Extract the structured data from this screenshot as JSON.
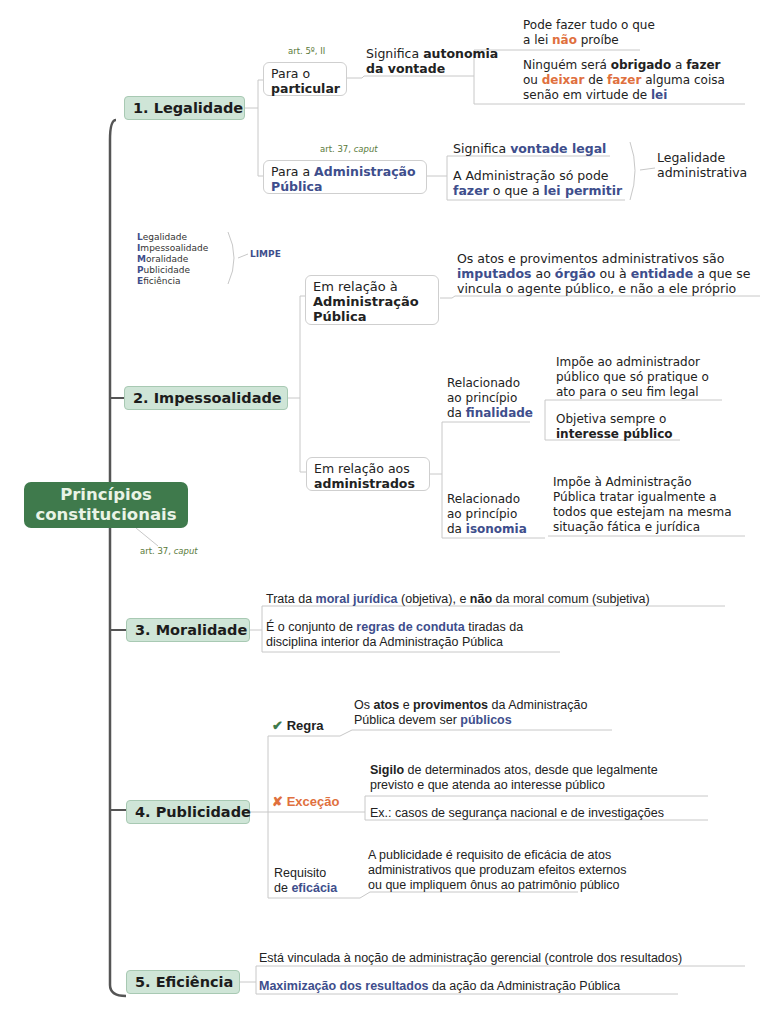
{
  "central": {
    "line1": "Princípios",
    "line2": "constitucionais",
    "note_prefix": "art. 37, ",
    "note_italic": "caput"
  },
  "colors": {
    "central_bg": "#3f7a4c",
    "main_bg": "#cfe5d7",
    "blue": "#3e4e8c",
    "orange": "#e0703e",
    "note": "#5a7a3a"
  },
  "legalidade": {
    "title": "1. Legalidade",
    "particular": {
      "note": "art. 5º, II",
      "line1": "Para o",
      "line2": "particular",
      "meaning_a": "Significa ",
      "meaning_b": "autonomia",
      "meaning_c": "da vontade",
      "leaf1_a": "Pode fazer tudo o que",
      "leaf1_b": "a lei ",
      "leaf1_c": "não",
      "leaf1_d": " proíbe",
      "leaf2_a": "Ninguém será ",
      "leaf2_b": "obrigado",
      "leaf2_c": " a ",
      "leaf2_d": "fazer",
      "leaf2_e": "ou ",
      "leaf2_f": "deixar",
      "leaf2_g": " de ",
      "leaf2_h": "fazer",
      "leaf2_i": " alguma coisa",
      "leaf2_j": "senão em virtude de ",
      "leaf2_k": "lei"
    },
    "adm": {
      "note_prefix": "art. 37, ",
      "note_italic": "caput",
      "line1a": "Para a ",
      "line1b": "Administração",
      "line2": "Pública",
      "leaf1_a": "Significa ",
      "leaf1_b": "vontade legal",
      "leaf2_a": "A Administração só pode",
      "leaf2_b": "fazer",
      "leaf2_c": " o que a ",
      "leaf2_d": "lei permitir",
      "summary1": "Legalidade",
      "summary2": "administrativa"
    }
  },
  "limpe": {
    "items": [
      {
        "first": "L",
        "rest": "egalidade"
      },
      {
        "first": "I",
        "rest": "mpessoalidade"
      },
      {
        "first": "M",
        "rest": "oralidade"
      },
      {
        "first": "P",
        "rest": "ublicidade"
      },
      {
        "first": "E",
        "rest": "ficiência"
      }
    ],
    "label": "LIMPE"
  },
  "impessoalidade": {
    "title": "2. Impessoalidade",
    "adm": {
      "line1": "Em relação à",
      "line2": "Administração",
      "line3": "Pública",
      "leaf_a": "Os atos e provimentos administrativos são",
      "leaf_b": "imputados",
      "leaf_c": " ao ",
      "leaf_d": "órgão",
      "leaf_e": " ou à ",
      "leaf_f": "entidade",
      "leaf_g": " a que se",
      "leaf_h": "vincula o agente público, e não a ele próprio"
    },
    "administrados": {
      "line1": "Em relação aos",
      "line2": "administrados",
      "finalidade": {
        "l1": "Relacionado",
        "l2": "ao princípio",
        "l3a": "da ",
        "l3b": "finalidade",
        "leaf1_a": "Impõe ao administrador",
        "leaf1_b": "público que só pratique o",
        "leaf1_c": "ato para o seu fim legal",
        "leaf2_a": "Objetiva sempre o",
        "leaf2_b": "interesse público"
      },
      "isonomia": {
        "l1": "Relacionado",
        "l2": "ao princípio",
        "l3a": "da ",
        "l3b": "isonomia",
        "leaf_a": "Impõe à Administração",
        "leaf_b": "Pública tratar igualmente a",
        "leaf_c": "todos que estejam na mesma",
        "leaf_d": "situação fática e jurídica"
      }
    }
  },
  "moralidade": {
    "title": "3. Moralidade",
    "leaf1_a": "Trata da ",
    "leaf1_b": "moral jurídica",
    "leaf1_c": " (objetiva), e ",
    "leaf1_d": "não",
    "leaf1_e": " da moral comum (subjetiva)",
    "leaf2_a": "É o conjunto de ",
    "leaf2_b": "regras de conduta",
    "leaf2_c": " tiradas da",
    "leaf2_d": "disciplina interior da Administração Pública"
  },
  "publicidade": {
    "title": "4. Publicidade",
    "regra": {
      "icon": "✔",
      "label": "Regra",
      "a": "Os ",
      "b": "atos",
      "c": " e ",
      "d": "provimentos",
      "e": " da Administração",
      "f": "Pública devem ser ",
      "g": "públicos"
    },
    "excecao": {
      "icon": "✘",
      "label": "Exceção",
      "leaf1_a": "Sigilo",
      "leaf1_b": " de determinados atos, desde que legalmente",
      "leaf1_c": "previsto e que atenda ao interesse público",
      "leaf2": "Ex.: casos de segurança nacional e de investigações"
    },
    "eficacia": {
      "l1": "Requisito",
      "l2a": "de ",
      "l2b": "eficácia",
      "leaf_a": "A publicidade é requisito de eficácia de atos",
      "leaf_b": "administrativos que produzam efeitos externos",
      "leaf_c": "ou que impliquem ônus ao patrimônio público"
    }
  },
  "eficiencia": {
    "title": "5. Eficiência",
    "leaf1": "Está vinculada à noção de administração gerencial (controle dos resultados)",
    "leaf2_a": "Maximização dos resultados",
    "leaf2_b": " da ação da Administração Pública"
  }
}
